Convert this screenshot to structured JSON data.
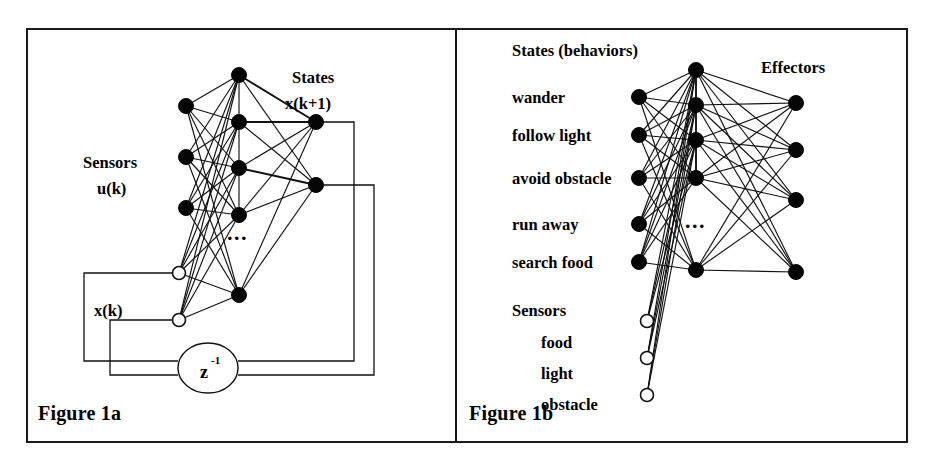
{
  "figure_set": {
    "background_color": "#ffffff",
    "ink_color": "#000000",
    "panel_count": 2
  },
  "panel_a": {
    "caption": "Figure 1a",
    "labels": {
      "sensors_title": "Sensors",
      "sensors_symbol": "u(k)",
      "states_title": "States",
      "states_symbol": "x(k+1)",
      "state_feedback_symbol": "x(k)",
      "delay_block": "z",
      "delay_exponent": "-1",
      "hidden_ellipsis": "..."
    },
    "layers": {
      "sensor_nodes": {
        "count": 3,
        "style": "filled"
      },
      "state_feedback_nodes": {
        "count": 2,
        "style": "open"
      },
      "hidden_nodes": {
        "count": 5,
        "style": "filled",
        "ellipsis_between": true
      },
      "output_state_nodes": {
        "count": 2,
        "style": "filled"
      }
    },
    "description": "Recurrent neural network: sensor inputs u(k) and delayed states x(k) feed a fully connected hidden layer producing next states x(k+1), fed back through a z-inverse unit delay."
  },
  "panel_b": {
    "caption": "Figure 1b",
    "labels": {
      "states_title": "States (behaviors)",
      "effectors_title": "Effectors",
      "sensors_title": "Sensors",
      "hidden_ellipsis": "..."
    },
    "behaviors": [
      "wander",
      "follow light",
      "avoid obstacle",
      "run away",
      "search food"
    ],
    "sensors": [
      "food",
      "light",
      "obstacle"
    ],
    "layers": {
      "behavior_nodes": {
        "count": 5,
        "style": "filled"
      },
      "sensor_nodes": {
        "count": 3,
        "style": "open"
      },
      "hidden_nodes": {
        "count": 5,
        "style": "filled",
        "ellipsis_between": true
      },
      "effector_nodes": {
        "count": 4,
        "style": "filled"
      }
    },
    "description": "Behavior-based network: state (behavior) units and sensor units connect through a hidden layer to effector outputs."
  }
}
